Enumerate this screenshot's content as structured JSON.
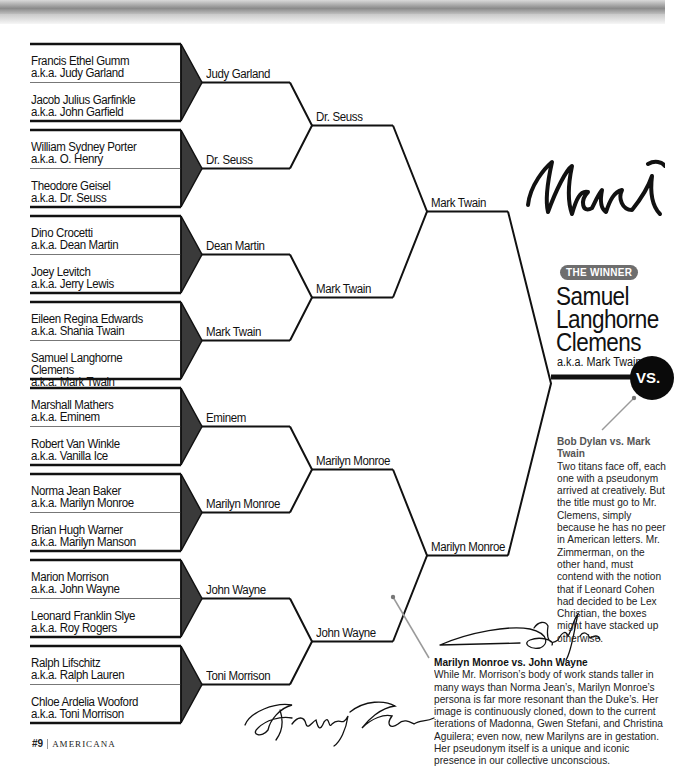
{
  "page": {
    "number": "#9",
    "section": "AMERICANA"
  },
  "bracket": {
    "round1": [
      {
        "name": "Francis Ethel Gumm",
        "aka": "a.k.a. Judy Garland"
      },
      {
        "name": "Jacob Julius Garfinkle",
        "aka": "a.k.a. John Garfield"
      },
      {
        "name": "William Sydney Porter",
        "aka": "a.k.a. O. Henry"
      },
      {
        "name": "Theodore Geisel",
        "aka": "a.k.a. Dr. Seuss"
      },
      {
        "name": "Dino Crocetti",
        "aka": "a.k.a. Dean Martin"
      },
      {
        "name": "Joey Levitch",
        "aka": "a.k.a. Jerry Lewis"
      },
      {
        "name": "Eileen Regina Edwards",
        "aka": "a.k.a. Shania Twain"
      },
      {
        "name": "Samuel Langhorne Clemens",
        "aka": "a.k.a. Mark Twain"
      },
      {
        "name": "Marshall Mathers",
        "aka": "a.k.a. Eminem"
      },
      {
        "name": "Robert Van Winkle",
        "aka": "a.k.a. Vanilla Ice"
      },
      {
        "name": "Norma Jean Baker",
        "aka": "a.k.a. Marilyn Monroe"
      },
      {
        "name": "Brian Hugh Warner",
        "aka": "a.k.a. Marilyn Manson"
      },
      {
        "name": "Marion Morrison",
        "aka": "a.k.a. John Wayne"
      },
      {
        "name": "Leonard Franklin Slye",
        "aka": "a.k.a. Roy Rogers"
      },
      {
        "name": "Ralph Lifschitz",
        "aka": "a.k.a. Ralph Lauren"
      },
      {
        "name": "Chloe Ardelia Wooford",
        "aka": "a.k.a. Toni Morrison"
      }
    ],
    "round2": [
      "Judy Garland",
      "Dr. Seuss",
      "Dean Martin",
      "Mark Twain",
      "Eminem",
      "Marilyn Monroe",
      "John Wayne",
      "Toni Morrison"
    ],
    "round3": [
      "Dr. Seuss",
      "Mark Twain",
      "Marilyn Monroe",
      "John Wayne"
    ],
    "semis": [
      "Mark Twain",
      "Marilyn Monroe"
    ]
  },
  "winner": {
    "badge": "THE WINNER",
    "name": "Samuel Langhorne Clemens",
    "aka": "a.k.a. Mark Twain",
    "vs_label": "VS.",
    "signature": "Mark"
  },
  "notes": {
    "final": {
      "title": "Bob Dylan vs. Mark Twain",
      "body": "Two titans face off, each one with a pseudonym arrived at creatively. But the title must go to Mr. Clemens, simply because he has no peer in American letters. Mr. Zimmerman, on the other hand, must contend with the notion that if Leonard Cohen had decided to be Lex Christian, the boxes might have stacked up otherwise."
    },
    "semifinal": {
      "title": "Marilyn Monroe vs. John Wayne",
      "body": "While Mr. Morrison’s body of work stands taller in many ways than Norma Jean’s, Marilyn Monroe’s persona is far more resonant than the Duke’s. Her image is continuously cloned, down to the current iterations of Madonna, Gwen Stefani, and Christina Aguilera; even now, new Marilyns are in gestation. Her pseudonym itself is a unique and iconic presence in our collective unconscious."
    }
  },
  "colors": {
    "line": "#111111",
    "triangle": "#3a3a3a",
    "badge": "#6e6e6e",
    "pin": "#8a8a8a"
  }
}
